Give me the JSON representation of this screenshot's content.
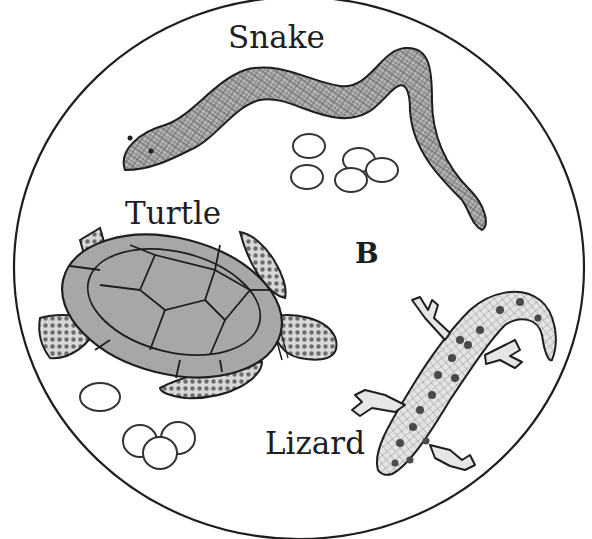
{
  "figure": {
    "panel_label": "B",
    "background": "#ffffff",
    "line_color": "#1e1e1e",
    "animals": [
      {
        "name": "Snake",
        "eggs": 5
      },
      {
        "name": "Turtle",
        "eggs": 4
      },
      {
        "name": "Lizard",
        "eggs": 0
      }
    ]
  }
}
